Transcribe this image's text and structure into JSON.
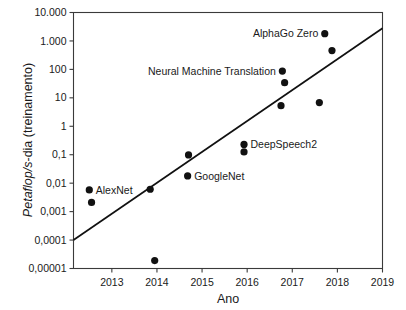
{
  "chart_data": {
    "type": "scatter",
    "title": "",
    "xlabel": "Ano",
    "ylabel": "Petaflop/s-dia (treinamento)",
    "ylabel_italic_part": "Petaflop/s",
    "ylabel_rest": "-dia (treinamento)",
    "xlim": [
      2012.15,
      2019.0
    ],
    "ylim": [
      1e-05,
      10000
    ],
    "yscale": "log",
    "xscale": "linear",
    "grid": false,
    "legend": false,
    "x_ticks": [
      2013,
      2014,
      2015,
      2016,
      2017,
      2018,
      2019
    ],
    "x_tick_labels": [
      "2013",
      "2014",
      "2015",
      "2016",
      "2017",
      "2018",
      "2019"
    ],
    "y_ticks": [
      10000,
      1000,
      100,
      10,
      1,
      0.1,
      0.01,
      0.001,
      0.0001,
      1e-05
    ],
    "y_tick_labels": [
      "10.000",
      "1.000",
      "100",
      "10",
      "1",
      "0,1",
      "0,01",
      "0,001",
      "0,0001",
      "0,00001"
    ],
    "points": [
      {
        "label": "AlexNet",
        "label_side": "right",
        "x": 2012.5,
        "y": 0.0058
      },
      {
        "label": "",
        "label_side": "none",
        "x": 2012.55,
        "y": 0.0021
      },
      {
        "label": "",
        "label_side": "none",
        "x": 2013.85,
        "y": 0.0061
      },
      {
        "label": "",
        "label_side": "none",
        "x": 2013.95,
        "y": 1.9e-05
      },
      {
        "label": "",
        "label_side": "none",
        "x": 2014.7,
        "y": 0.098
      },
      {
        "label": "GoogleNet",
        "label_side": "right",
        "x": 2014.68,
        "y": 0.018
      },
      {
        "label": "DeepSpeech2",
        "label_side": "right",
        "x": 2015.93,
        "y": 0.23
      },
      {
        "label": "",
        "label_side": "none",
        "x": 2015.93,
        "y": 0.125
      },
      {
        "label": "Neural Machine Translation",
        "label_side": "left",
        "x": 2016.78,
        "y": 87
      },
      {
        "label": "",
        "label_side": "none",
        "x": 2016.83,
        "y": 34
      },
      {
        "label": "",
        "label_side": "none",
        "x": 2016.75,
        "y": 5.3
      },
      {
        "label": "",
        "label_side": "none",
        "x": 2017.6,
        "y": 6.8
      },
      {
        "label": "AlphaGo Zero",
        "label_side": "left",
        "x": 2017.72,
        "y": 1800
      },
      {
        "label": "",
        "label_side": "none",
        "x": 2017.88,
        "y": 460
      }
    ],
    "trend_line": {
      "x_start": 2012.15,
      "y_start": 0.0001,
      "x_end": 2019.0,
      "y_end": 2800
    },
    "colors": {
      "marker": "#111111",
      "trend": "#111111",
      "axis": "#3a3a3a",
      "text": "#1a1a1a",
      "background": "#ffffff"
    }
  },
  "labels": {
    "alexnet": "AlexNet",
    "googlenet": "GoogleNet",
    "deepspeech2": "DeepSpeech2",
    "nmt": "Neural Machine Translation",
    "alphago": "AlphaGo Zero"
  },
  "axes": {
    "x_title": "Ano",
    "y_title_italic": "Petaflop/s",
    "y_title_rest": "-dia (treinamento)",
    "y_tick_10000": "10.000",
    "y_tick_1000": "1.000",
    "y_tick_100": "100",
    "y_tick_10": "10",
    "y_tick_1": "1",
    "y_tick_0_1": "0,1",
    "y_tick_0_01": "0,01",
    "y_tick_0_001": "0,001",
    "y_tick_0_0001": "0,0001",
    "y_tick_0_00001": "0,00001",
    "x_tick_2013": "2013",
    "x_tick_2014": "2014",
    "x_tick_2015": "2015",
    "x_tick_2016": "2016",
    "x_tick_2017": "2017",
    "x_tick_2018": "2018",
    "x_tick_2019": "2019"
  }
}
